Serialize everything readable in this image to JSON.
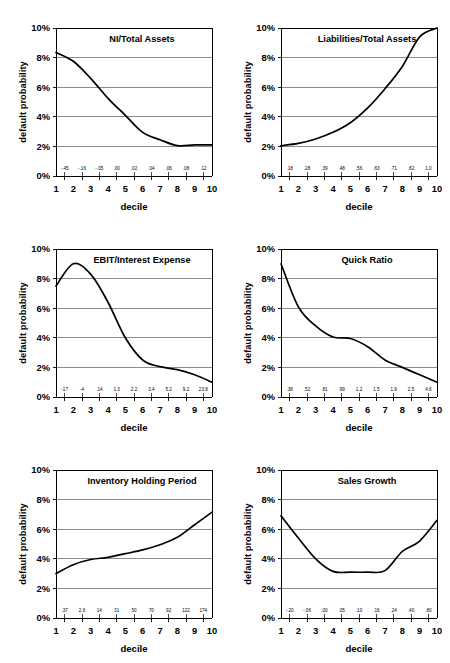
{
  "figure": {
    "layout": "2 columns x 3 rows of line charts",
    "background_color": "#ffffff",
    "line_color": "#000000",
    "gridline_color": "#808080"
  },
  "common": {
    "ylabel": "default probability",
    "xlabel": "decile",
    "y_ticks": [
      "0%",
      "2%",
      "4%",
      "6%",
      "8%",
      "10%"
    ],
    "decile_labels": [
      "1",
      "2",
      "3",
      "4",
      "5",
      "6",
      "7",
      "8",
      "9",
      "10"
    ],
    "ylim": [
      0,
      10
    ],
    "xlim": [
      1,
      10
    ],
    "grid": "horizontal"
  },
  "chart_data": [
    {
      "id": "ni-total-assets",
      "type": "line",
      "title": "NI/Total Assets",
      "xlabel": "decile",
      "ylabel": "default probability",
      "ylim": [
        0,
        10
      ],
      "categories": [
        "1",
        "2",
        "3",
        "4",
        "5",
        "6",
        "7",
        "8",
        "9",
        "10"
      ],
      "values": [
        8.35,
        7.75,
        6.6,
        5.25,
        4.1,
        2.95,
        2.45,
        2.05,
        2.1,
        2.1
      ],
      "secondary_axis_labels": [
        "-.45",
        "-.16",
        "-.05",
        ".00",
        ".02",
        ".04",
        ".06",
        ".08",
        ".12"
      ],
      "grid": "horizontal",
      "legend": "none"
    },
    {
      "id": "liabilities-total-assets",
      "type": "line",
      "title": "Liabilities/Total Assets",
      "xlabel": "decile",
      "ylabel": "default probability",
      "ylim": [
        0,
        10
      ],
      "categories": [
        "1",
        "2",
        "3",
        "4",
        "5",
        "6",
        "7",
        "8",
        "9",
        "10"
      ],
      "values": [
        2.05,
        2.2,
        2.5,
        2.95,
        3.6,
        4.6,
        5.9,
        7.4,
        9.4,
        10.0
      ],
      "secondary_axis_labels": [
        ".18",
        ".28",
        ".39",
        ".48",
        ".56",
        ".63",
        ".71",
        ".82",
        "1.0"
      ],
      "grid": "horizontal",
      "legend": "none"
    },
    {
      "id": "ebit-interest-expense",
      "type": "line",
      "title": "EBIT/Interest Expense",
      "xlabel": "decile",
      "ylabel": "default probability",
      "ylim": [
        0,
        10
      ],
      "categories": [
        "1",
        "2",
        "3",
        "4",
        "5",
        "6",
        "7",
        "8",
        "9",
        "10"
      ],
      "values": [
        7.5,
        9.0,
        8.3,
        6.4,
        4.0,
        2.5,
        2.05,
        1.85,
        1.5,
        1.0
      ],
      "secondary_axis_labels": [
        "-17",
        "-4",
        ".14",
        "1.3",
        "2.2",
        "3.4",
        "5.2",
        "9.2",
        "23.8"
      ],
      "grid": "horizontal",
      "legend": "none"
    },
    {
      "id": "quick-ratio",
      "type": "line",
      "title": "Quick Ratio",
      "xlabel": "decile",
      "ylabel": "default probability",
      "ylim": [
        0,
        10
      ],
      "categories": [
        "1",
        "2",
        "3",
        "4",
        "5",
        "6",
        "7",
        "8",
        "9",
        "10"
      ],
      "values": [
        9.0,
        6.1,
        4.8,
        4.05,
        3.95,
        3.4,
        2.5,
        2.0,
        1.5,
        1.0
      ],
      "secondary_axis_labels": [
        ".38",
        ".52",
        ".81",
        ".99",
        "1.2",
        "1.5",
        "1.9",
        "2.5",
        "4.6"
      ],
      "grid": "horizontal",
      "legend": "none"
    },
    {
      "id": "inventory-holding-period",
      "type": "line",
      "title": "Inventory Holding Period",
      "xlabel": "decile",
      "ylabel": "default probability",
      "ylim": [
        0,
        10
      ],
      "categories": [
        "1",
        "2",
        "3",
        "4",
        "5",
        "6",
        "7",
        "8",
        "9",
        "10"
      ],
      "values": [
        3.0,
        3.6,
        3.95,
        4.1,
        4.35,
        4.6,
        4.95,
        5.45,
        6.3,
        7.15
      ],
      "secondary_axis_labels": [
        ".37",
        "2.6",
        "14",
        "31",
        "50",
        "70",
        "92",
        "122",
        "174"
      ],
      "grid": "horizontal",
      "legend": "none"
    },
    {
      "id": "sales-growth",
      "type": "line",
      "title": "Sales Growth",
      "xlabel": "decile",
      "ylabel": "default probability",
      "ylim": [
        0,
        10
      ],
      "categories": [
        "1",
        "2",
        "3",
        "4",
        "5",
        "6",
        "7",
        "8",
        "9",
        "10"
      ],
      "values": [
        6.9,
        5.4,
        4.0,
        3.15,
        3.1,
        3.1,
        3.2,
        4.5,
        5.2,
        6.6
      ],
      "secondary_axis_labels": [
        "-.20",
        "-.06",
        ".00",
        ".05",
        ".10",
        ".16",
        ".24",
        ".40",
        ".80"
      ],
      "grid": "horizontal",
      "legend": "none"
    }
  ]
}
